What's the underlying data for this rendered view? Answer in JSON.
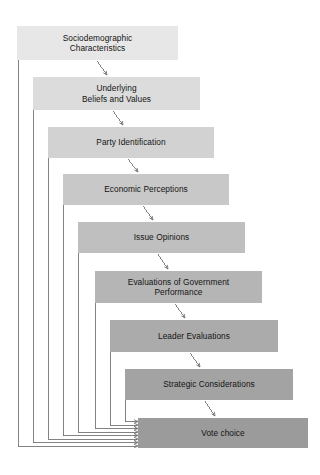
{
  "diagram": {
    "type": "flowchart",
    "canvas": {
      "width": 320,
      "height": 475,
      "background": "#ffffff"
    },
    "nodes": [
      {
        "id": "sociodemographic",
        "label": "Sociodemographic\nCharacteristics",
        "line1": "Sociodemographic",
        "line2": "Characteristics",
        "x": 17,
        "y": 26,
        "w": 161,
        "h": 34,
        "fill": "#e7e7e7"
      },
      {
        "id": "beliefs",
        "label": "Underlying\nBeliefs and Values",
        "line1": "Underlying",
        "line2": "Beliefs and Values",
        "x": 33,
        "y": 77,
        "w": 167,
        "h": 33,
        "fill": "#dcdcdc"
      },
      {
        "id": "party-id",
        "label": "Party Identification",
        "line1": "Party Identification",
        "line2": "",
        "x": 48,
        "y": 127,
        "w": 166,
        "h": 31,
        "fill": "#d2d2d2"
      },
      {
        "id": "economic",
        "label": "Economic Perceptions",
        "line1": "Economic Perceptions",
        "line2": "",
        "x": 63,
        "y": 174,
        "w": 166,
        "h": 31,
        "fill": "#c8c8c8"
      },
      {
        "id": "issue-opinions",
        "label": "Issue Opinions",
        "line1": "Issue Opinions",
        "line2": "",
        "x": 78,
        "y": 222,
        "w": 167,
        "h": 31,
        "fill": "#bfbfbf"
      },
      {
        "id": "gov-performance",
        "label": "Evaluations of Government\nPerformance",
        "line1": "Evaluations of Government",
        "line2": "Performance",
        "x": 95,
        "y": 271,
        "w": 167,
        "h": 32,
        "fill": "#b5b5b5"
      },
      {
        "id": "leader-evaluations",
        "label": "Leader Evaluations",
        "line1": "Leader Evaluations",
        "line2": "",
        "x": 110,
        "y": 320,
        "w": 168,
        "h": 32,
        "fill": "#ababab"
      },
      {
        "id": "strategic",
        "label": "Strategic Considerations",
        "line1": "Strategic Considerations",
        "line2": "",
        "x": 125,
        "y": 369,
        "w": 168,
        "h": 31,
        "fill": "#a3a3a3"
      },
      {
        "id": "vote-choice",
        "label": "Vote choice",
        "line1": "Vote choice",
        "line2": "",
        "x": 138,
        "y": 418,
        "w": 170,
        "h": 30,
        "fill": "#9b9b9b"
      }
    ],
    "sequential_arrows": [
      {
        "from": "sociodemographic",
        "to": "beliefs",
        "x1": 97,
        "y1": 61,
        "x2": 107,
        "y2": 75
      },
      {
        "from": "beliefs",
        "to": "party-id",
        "x1": 113,
        "y1": 111,
        "x2": 123,
        "y2": 125
      },
      {
        "from": "party-id",
        "to": "economic",
        "x1": 128,
        "y1": 159,
        "x2": 138,
        "y2": 172
      },
      {
        "from": "economic",
        "to": "issue-opinions",
        "x1": 143,
        "y1": 206,
        "x2": 153,
        "y2": 220
      },
      {
        "from": "issue-opinions",
        "to": "gov-performance",
        "x1": 158,
        "y1": 254,
        "x2": 168,
        "y2": 269
      },
      {
        "from": "gov-performance",
        "to": "leader-evaluations",
        "x1": 175,
        "y1": 304,
        "x2": 185,
        "y2": 318
      },
      {
        "from": "leader-evaluations",
        "to": "strategic",
        "x1": 190,
        "y1": 353,
        "x2": 200,
        "y2": 367
      },
      {
        "from": "strategic",
        "to": "vote-choice",
        "x1": 205,
        "y1": 401,
        "x2": 215,
        "y2": 416
      }
    ],
    "direct_arrows_to_vote_choice": [
      {
        "from": "strategic",
        "left_x": 125,
        "drop_from_y": 400,
        "turn_y": 421.5
      },
      {
        "from": "leader-evaluations",
        "left_x": 110,
        "drop_from_y": 352,
        "turn_y": 425
      },
      {
        "from": "gov-performance",
        "left_x": 95,
        "drop_from_y": 303,
        "turn_y": 428.5
      },
      {
        "from": "issue-opinions",
        "left_x": 78,
        "drop_from_y": 253,
        "turn_y": 432
      },
      {
        "from": "economic",
        "left_x": 63,
        "drop_from_y": 205,
        "turn_y": 435.5
      },
      {
        "from": "party-id",
        "left_x": 48,
        "drop_from_y": 158,
        "turn_y": 439
      },
      {
        "from": "beliefs",
        "left_x": 33,
        "drop_from_y": 110,
        "turn_y": 442.5
      },
      {
        "from": "sociodemographic",
        "left_x": 18,
        "drop_from_y": 60,
        "turn_y": 446
      }
    ],
    "arrow_target_x": 137,
    "line_color": "#6d6d6d",
    "text_color": "#141414"
  }
}
